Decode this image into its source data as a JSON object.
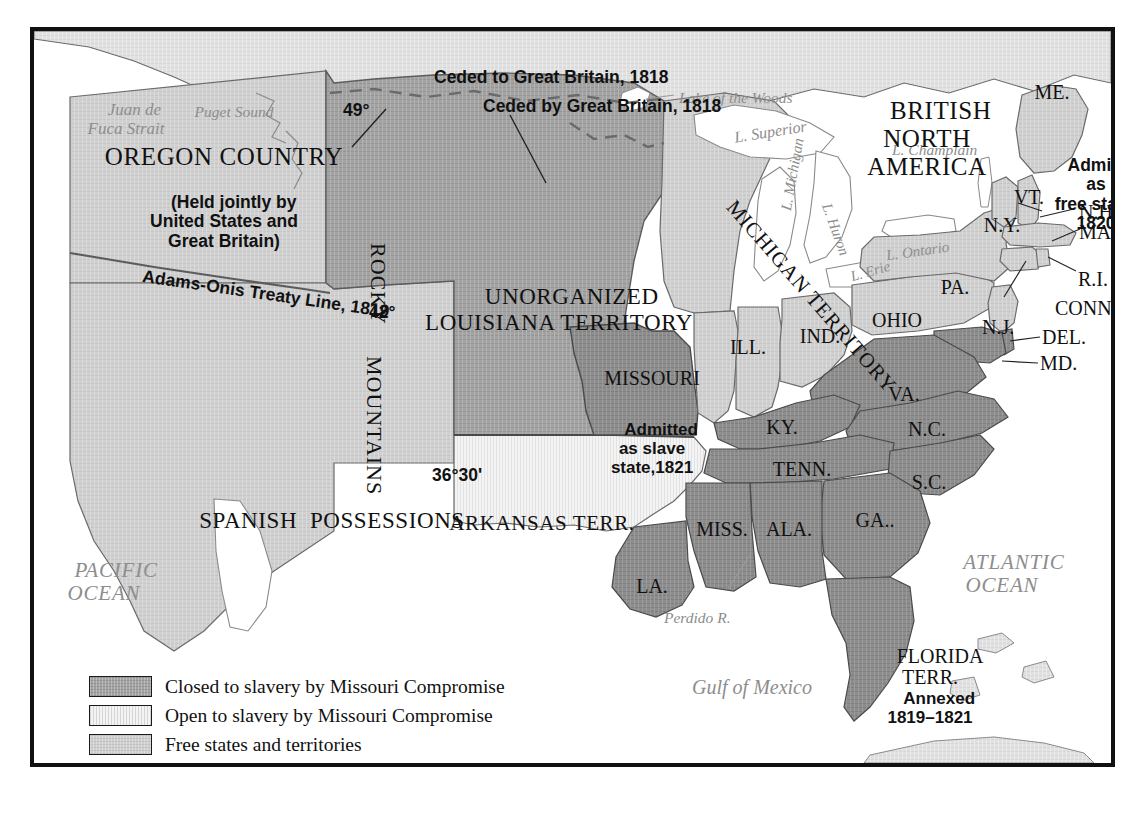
{
  "map": {
    "title_regions": {
      "oregon": "OREGON COUNTRY",
      "oregon_sub": "(Held jointly by\nUnited States and\nGreat Britain)",
      "british_north_america": "BRITISH\nNORTH AMERICA",
      "unorganized": "UNORGANIZED\nLOUISIANA TERRITORY",
      "spanish": "SPANISH  POSSESSIONS",
      "michigan_territory": "MICHIGAN TERRITORY",
      "arkansas": "ARKANSAS TERR.",
      "rocky": "ROCKY",
      "mountains": "MOUNTAINS"
    },
    "annotations": {
      "ceded_to_gb": "Ceded to Great Britain, 1818",
      "ceded_by_gb": "Ceded by Great Britain, 1818",
      "adams_onis": "Adams-Onis Treaty Line, 1819",
      "lat_49": "49°",
      "lat_42": "42°",
      "lat_3630": "36°30'",
      "maine_note": "Admitted as\nfree state, 1820",
      "missouri_note": "Admitted\nas slave\nstate,1821",
      "florida_note": "Annexed\n1819–1821"
    },
    "water_labels": {
      "juan_de_fuca": "Juan de\nFuca Strait",
      "puget_sound": "Puget Sound",
      "lake_of_the_woods": "Lake of the Woods",
      "superior": "L. Superior",
      "michigan": "L. Michigan",
      "huron": "L. Huron",
      "erie": "L. Erie",
      "ontario": "L. Ontario",
      "champlain": "L. Champlain",
      "pacific": "PACIFIC\nOCEAN",
      "atlantic": "ATLANTIC\nOCEAN",
      "gulf": "Gulf of Mexico",
      "perdido": "Perdido R."
    },
    "states": [
      {
        "key": "missouri",
        "label": "MISSOURI"
      },
      {
        "key": "illinois",
        "label": "ILL."
      },
      {
        "key": "indiana",
        "label": "IND."
      },
      {
        "key": "ohio",
        "label": "OHIO"
      },
      {
        "key": "pennsylvania",
        "label": "PA."
      },
      {
        "key": "newyork",
        "label": "N.Y."
      },
      {
        "key": "vermont",
        "label": "VT."
      },
      {
        "key": "maine",
        "label": "ME."
      },
      {
        "key": "newhampshire",
        "label": "N.H."
      },
      {
        "key": "massachusetts",
        "label": "MASS."
      },
      {
        "key": "rhodeisland",
        "label": "R.I."
      },
      {
        "key": "connecticut",
        "label": "CONN."
      },
      {
        "key": "newjersey",
        "label": "N.J."
      },
      {
        "key": "delaware",
        "label": "DEL."
      },
      {
        "key": "maryland",
        "label": "MD."
      },
      {
        "key": "virginia",
        "label": "VA."
      },
      {
        "key": "kentucky",
        "label": "KY."
      },
      {
        "key": "northcarolina",
        "label": "N.C."
      },
      {
        "key": "tennessee",
        "label": "TENN."
      },
      {
        "key": "southcarolina",
        "label": "S.C."
      },
      {
        "key": "mississippi",
        "label": "MISS."
      },
      {
        "key": "alabama",
        "label": "ALA."
      },
      {
        "key": "georgia",
        "label": "GA.."
      },
      {
        "key": "louisiana",
        "label": "LA."
      },
      {
        "key": "florida",
        "label": "FLORIDA\nTERR."
      }
    ]
  },
  "legend": {
    "items": [
      {
        "swatch": "closed",
        "label": "Closed to slavery by Missouri Compromise"
      },
      {
        "swatch": "open",
        "label": "Open to slavery by Missouri Compromise"
      },
      {
        "swatch": "free",
        "label": "Free states and territories"
      },
      {
        "swatch": "slave",
        "label": "Slave states and territories"
      }
    ]
  },
  "colors": {
    "closed_to_slavery": "#a3a3a3",
    "open_to_slavery": "#f3f3f3",
    "free_states": "#cfcfcf",
    "slave_states": "#8d8d8d",
    "water": "#ffffff",
    "foreign_land": "#e0e0e0",
    "border": "#111111",
    "water_label": "#8d8d8d"
  }
}
